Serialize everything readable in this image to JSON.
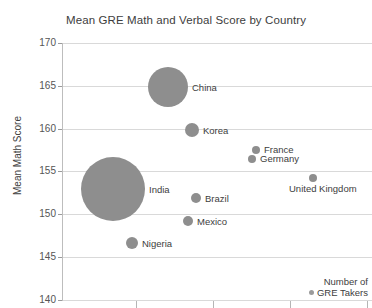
{
  "chart_data": {
    "type": "scatter",
    "title": "Mean GRE Math and Verbal Score by Country",
    "xlabel": "",
    "ylabel": "Mean Math Score",
    "ylim": [
      140,
      170
    ],
    "yticks": [
      170,
      165,
      160,
      155,
      150,
      145,
      140
    ],
    "grid": true,
    "legend_position": "bottom-right",
    "size_legend_title_line1": "Number of",
    "size_legend_title_line2": "GRE Takers",
    "bubble_color": "#8e8e8e",
    "points": [
      {
        "label": "China",
        "y": 164.7,
        "px": 168,
        "py": 87,
        "r": 20,
        "label_dx": 24,
        "label_dy": -4
      },
      {
        "label": "Korea",
        "y": 160.0,
        "px": 192,
        "py": 130,
        "r": 7,
        "label_dx": 11,
        "label_dy": -4
      },
      {
        "label": "France",
        "y": 157.1,
        "px": 256,
        "py": 150,
        "r": 4,
        "label_dx": 8,
        "label_dy": -5
      },
      {
        "label": "Germany",
        "y": 156.1,
        "px": 252,
        "py": 159,
        "r": 4,
        "label_dx": 8,
        "label_dy": -5
      },
      {
        "label": "United Kingdom",
        "y": 153.8,
        "px": 313,
        "py": 178,
        "r": 4,
        "label_dx": -24,
        "label_dy": 6
      },
      {
        "label": "India",
        "y": 153.3,
        "px": 113,
        "py": 189,
        "r": 32,
        "label_dx": 36,
        "label_dy": -4
      },
      {
        "label": "Brazil",
        "y": 152.0,
        "px": 196,
        "py": 198,
        "r": 5,
        "label_dx": 9,
        "label_dy": -4
      },
      {
        "label": "Mexico",
        "y": 149.4,
        "px": 188,
        "py": 221,
        "r": 5,
        "label_dx": 9,
        "label_dy": -4
      },
      {
        "label": "Nigeria",
        "y": 146.8,
        "px": 132,
        "py": 243,
        "r": 6,
        "label_dx": 10,
        "label_dy": -4
      }
    ],
    "xticks_px": [
      136,
      213,
      290,
      367
    ]
  },
  "axis": {
    "y_labels": [
      "170",
      "165",
      "160",
      "155",
      "150",
      "145",
      "140"
    ],
    "y_label_positions_px": [
      43,
      86,
      129,
      171,
      214,
      257,
      300
    ],
    "y_title": "Mean Math Score"
  },
  "legend": {
    "line1": "Number of",
    "line2": "GRE Takers"
  }
}
